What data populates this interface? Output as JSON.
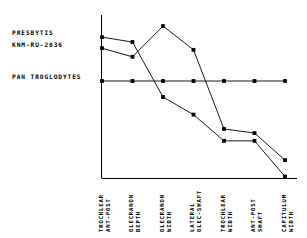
{
  "legend": {
    "series_labels": [
      "PRESBYTIS",
      "KNM-RU-2036"
    ],
    "baseline_label": "PAN TROGLODYTES"
  },
  "axis": {
    "categories": [
      [
        "TROCHLEAR",
        "ANT-POST"
      ],
      [
        "OLECRANON",
        "DEPTH"
      ],
      [
        "OLECRANON",
        "WIDTH"
      ],
      [
        "LATERAL",
        "OLEC-SHAFT"
      ],
      [
        "TROCHLEAR",
        "WIDTH"
      ],
      [
        "ANT-POST",
        "SHAFT"
      ],
      [
        "CAPITULUM",
        "WIDTH"
      ]
    ]
  },
  "colors": {
    "line": "#000000",
    "marker": "#000000",
    "axis": "#000000",
    "background": "#ffffff"
  },
  "chart_data": {
    "type": "line",
    "title": "",
    "xlabel": "",
    "ylabel": "",
    "grid": false,
    "legend_position": "left",
    "categories": [
      "TROCHLEAR ANT-POST",
      "OLECRANON DEPTH",
      "OLECRANON WIDTH",
      "LATERAL OLEC-SHAFT",
      "TROCHLEAR WIDTH",
      "ANT-POST SHAFT",
      "CAPITULUM WIDTH"
    ],
    "ylim": [
      -2.4,
      1.6
    ],
    "series": [
      {
        "name": "PRESBYTIS",
        "values": [
          1.07,
          0.95,
          -0.39,
          -0.82,
          -1.46,
          -1.46,
          -2.33
        ]
      },
      {
        "name": "KNM-RU-2036",
        "values": [
          0.8,
          0.59,
          1.34,
          0.76,
          -1.17,
          -1.27,
          -1.93
        ]
      },
      {
        "name": "PAN TROGLODYTES",
        "values": [
          0,
          0,
          0,
          0,
          0,
          0,
          0
        ]
      }
    ]
  }
}
